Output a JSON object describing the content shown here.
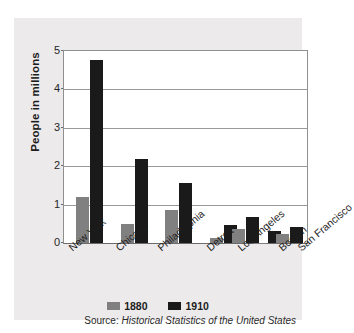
{
  "chart_data": {
    "type": "bar",
    "title": "",
    "xlabel": "",
    "ylabel": "People in millions",
    "ylim": [
      0,
      5
    ],
    "yticks": [
      "0",
      "1",
      "2",
      "3",
      "4",
      "5"
    ],
    "grid": true,
    "legend_position": "bottom",
    "categories": [
      "New York",
      "Chicago",
      "Philadelphia",
      "Detroit",
      "Los Angeles",
      "Boston",
      "San Francisco"
    ],
    "series": [
      {
        "name": "1880",
        "color": "#808080",
        "values": [
          1.21,
          0.5,
          0.85,
          0.12,
          0.01,
          0.36,
          0.23
        ]
      },
      {
        "name": "1910",
        "color": "#1a1a1a",
        "values": [
          4.77,
          2.19,
          1.55,
          0.47,
          0.32,
          0.67,
          0.42
        ]
      }
    ],
    "source_prefix": "Source:",
    "source_title": "Historical Statistics of the United States"
  }
}
